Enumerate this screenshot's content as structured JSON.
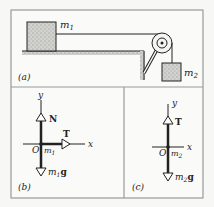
{
  "panel_a": {
    "label": "(a)",
    "block1": {
      "name": "m",
      "sub": "1"
    },
    "block2": {
      "name": "m",
      "sub": "2"
    }
  },
  "panel_b": {
    "label": "(b)",
    "y_axis": "y",
    "x_axis": "x",
    "origin": "O",
    "mass": {
      "name": "m",
      "sub": "1"
    },
    "forces": [
      {
        "symbol": "N",
        "direction": "up"
      },
      {
        "symbol": "T",
        "direction": "right"
      },
      {
        "symbol": "g",
        "prefix": "m",
        "sub": "1",
        "direction": "down"
      }
    ]
  },
  "panel_c": {
    "label": "(c)",
    "y_axis": "y",
    "x_axis": "x",
    "origin": "O",
    "mass": {
      "name": "m",
      "sub": "2"
    },
    "forces": [
      {
        "symbol": "T",
        "direction": "up"
      },
      {
        "symbol": "g",
        "prefix": "m",
        "sub": "2",
        "direction": "down"
      }
    ]
  },
  "colors": {
    "border": "#9a9a9a",
    "ink": "#222222",
    "block_fill": "#c8c8c4",
    "background": "#f7f7f5"
  }
}
